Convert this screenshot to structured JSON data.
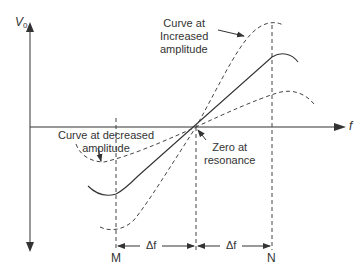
{
  "diagram": {
    "y_axis_label": "V",
    "y_axis_subscript": "0",
    "x_axis_label": "f",
    "annotations": {
      "increased_line1": "Curve at",
      "increased_line2": "Increased",
      "increased_line3": "amplitude",
      "decreased_line1": "Curve at decreased",
      "decreased_line2": "amplitude",
      "zero_line1": "Zero at",
      "zero_line2": "resonance"
    },
    "markers": {
      "left": "M",
      "right": "N"
    },
    "delta_left": "Δf",
    "delta_right": "Δf",
    "colors": {
      "line": "#333333",
      "background": "#ffffff"
    }
  }
}
